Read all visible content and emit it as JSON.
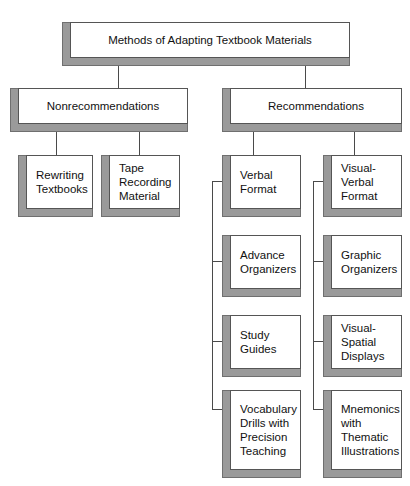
{
  "diagram": {
    "title": "Methods of Adapting Textbook Materials",
    "type": "hierarchy-flowchart",
    "colors": {
      "box_face": "#ffffff",
      "box_shadow": "#9a9a9a",
      "box_border": "#555555",
      "connector": "#4a4a4a",
      "text": "#111111",
      "background": "#ffffff"
    },
    "root": {
      "label": "Methods of Adapting Textbook Materials"
    },
    "branches": [
      {
        "id": "nonrecommendations",
        "label": "Nonrecommendations",
        "children": [
          {
            "id": "rewriting-textbooks",
            "label": "Rewriting\nTextbooks"
          },
          {
            "id": "tape-recording-material",
            "label": "Tape\nRecording\nMaterial"
          }
        ]
      },
      {
        "id": "recommendations",
        "label": "Recommendations",
        "columns": [
          {
            "id": "verbal-column",
            "head": {
              "id": "verbal-format",
              "label": "Verbal\nFormat"
            },
            "children": [
              {
                "id": "advance-organizers",
                "label": "Advance\nOrganizers"
              },
              {
                "id": "study-guides",
                "label": "Study\nGuides"
              },
              {
                "id": "vocabulary-drills-with-precision-teaching",
                "label": "Vocabulary\nDrills with\nPrecision\nTeaching"
              }
            ]
          },
          {
            "id": "visual-verbal-column",
            "head": {
              "id": "visual-verbal-format",
              "label": "Visual-Verbal\nFormat"
            },
            "children": [
              {
                "id": "graphic-organizers",
                "label": "Graphic\nOrganizers"
              },
              {
                "id": "visual-spatial-displays",
                "label": "Visual-\nSpatial\nDisplays"
              },
              {
                "id": "mnemonics-with-thematic-illustrations",
                "label": "Mnemonics\nwith\nThematic\nIllustrations"
              }
            ]
          }
        ]
      }
    ]
  }
}
